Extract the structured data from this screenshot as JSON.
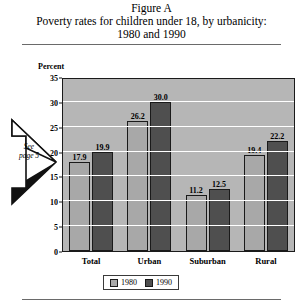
{
  "figure": {
    "title_lines": [
      "Figure A",
      "Poverty rates for children under 18, by urbanicity:",
      "1980 and 1990"
    ]
  },
  "annotation": {
    "line1": "See",
    "line2": "page 5",
    "icon": "right-arrow-icon"
  },
  "chart_data": {
    "type": "bar",
    "title": "Poverty rates for children under 18, by urbanicity: 1980 and 1990",
    "xlabel": "",
    "ylabel": "Percent",
    "ylim": [
      0,
      35
    ],
    "yticks": [
      0,
      5,
      10,
      15,
      20,
      25,
      30,
      35
    ],
    "ytick_labels": [
      "0",
      "5",
      "10",
      "15",
      "20",
      "25",
      "30",
      "35"
    ],
    "grid": true,
    "legend_position": "bottom",
    "categories": [
      "Total",
      "Urban",
      "Suburban",
      "Rural"
    ],
    "series": [
      {
        "name": "1980",
        "color": "#a8a8a8",
        "values": [
          17.9,
          26.2,
          11.2,
          19.4
        ],
        "labels": [
          "17.9",
          "26.2",
          "11.2",
          "19.4"
        ]
      },
      {
        "name": "1990",
        "color": "#4f4f4f",
        "values": [
          19.9,
          30.0,
          12.5,
          22.2
        ],
        "labels": [
          "19.9",
          "30.0",
          "12.5",
          "22.2"
        ]
      }
    ]
  }
}
